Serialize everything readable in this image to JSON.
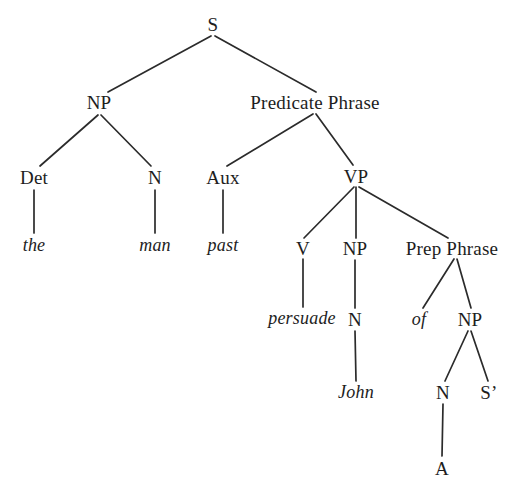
{
  "figure": {
    "kind": "syntax-tree",
    "background_color": "#ffffff",
    "ink_color": "#1d1d1d",
    "line_color": "#2b2b2b",
    "width": 518,
    "height": 500
  },
  "sentence": "the man past persuade John of A",
  "nodes": [
    {
      "id": "S",
      "label": "S",
      "kind": "category",
      "x": 213,
      "y": 24
    },
    {
      "id": "NP1",
      "label": "NP",
      "kind": "category",
      "x": 99,
      "y": 102
    },
    {
      "id": "PredP",
      "label": "Predicate Phrase",
      "kind": "category",
      "x": 315,
      "y": 102
    },
    {
      "id": "Det",
      "label": "Det",
      "kind": "category",
      "x": 34,
      "y": 177
    },
    {
      "id": "N1",
      "label": "N",
      "kind": "category",
      "x": 155,
      "y": 177
    },
    {
      "id": "Aux",
      "label": "Aux",
      "kind": "category",
      "x": 223,
      "y": 177
    },
    {
      "id": "VP",
      "label": "VP",
      "kind": "category",
      "x": 356,
      "y": 176
    },
    {
      "id": "the",
      "label": "the",
      "kind": "terminal",
      "x": 34,
      "y": 245
    },
    {
      "id": "man",
      "label": "man",
      "kind": "terminal",
      "x": 155,
      "y": 245
    },
    {
      "id": "past",
      "label": "past",
      "kind": "terminal",
      "x": 223,
      "y": 245
    },
    {
      "id": "V",
      "label": "V",
      "kind": "category",
      "x": 303,
      "y": 248
    },
    {
      "id": "NP2",
      "label": "NP",
      "kind": "category",
      "x": 355,
      "y": 248
    },
    {
      "id": "PrepP",
      "label": "Prep Phrase",
      "kind": "category",
      "x": 452,
      "y": 248
    },
    {
      "id": "persuade",
      "label": "persuade",
      "kind": "terminal",
      "x": 302,
      "y": 318
    },
    {
      "id": "N2",
      "label": "N",
      "kind": "category",
      "x": 355,
      "y": 319
    },
    {
      "id": "of",
      "label": "of",
      "kind": "terminal",
      "x": 419,
      "y": 319
    },
    {
      "id": "NP3",
      "label": "NP",
      "kind": "category",
      "x": 470,
      "y": 319
    },
    {
      "id": "John",
      "label": "John",
      "kind": "terminal",
      "x": 356,
      "y": 392
    },
    {
      "id": "N3",
      "label": "N",
      "kind": "category",
      "x": 443,
      "y": 392
    },
    {
      "id": "Sbar",
      "label": "S’",
      "kind": "category",
      "x": 489,
      "y": 392
    },
    {
      "id": "A",
      "label": "A",
      "kind": "category",
      "x": 442,
      "y": 468
    }
  ],
  "edges": [
    {
      "from": "S",
      "to": "NP1",
      "x1": 211,
      "y1": 36,
      "x2": 108,
      "y2": 92
    },
    {
      "from": "S",
      "to": "PredP",
      "x1": 215,
      "y1": 36,
      "x2": 316,
      "y2": 92
    },
    {
      "from": "NP1",
      "to": "Det",
      "x1": 98,
      "y1": 115,
      "x2": 40,
      "y2": 166
    },
    {
      "from": "NP1",
      "to": "N1",
      "x1": 101,
      "y1": 115,
      "x2": 151,
      "y2": 166
    },
    {
      "from": "PredP",
      "to": "Aux",
      "x1": 313,
      "y1": 114,
      "x2": 227,
      "y2": 166
    },
    {
      "from": "PredP",
      "to": "VP",
      "x1": 316,
      "y1": 114,
      "x2": 353,
      "y2": 165
    },
    {
      "from": "Det",
      "to": "the",
      "x1": 34,
      "y1": 190,
      "x2": 34,
      "y2": 233
    },
    {
      "from": "N1",
      "to": "man",
      "x1": 155,
      "y1": 190,
      "x2": 155,
      "y2": 233
    },
    {
      "from": "Aux",
      "to": "past",
      "x1": 223,
      "y1": 190,
      "x2": 223,
      "y2": 233
    },
    {
      "from": "VP",
      "to": "V",
      "x1": 354,
      "y1": 187,
      "x2": 304,
      "y2": 238
    },
    {
      "from": "VP",
      "to": "NP2",
      "x1": 356,
      "y1": 187,
      "x2": 356,
      "y2": 238
    },
    {
      "from": "VP",
      "to": "PrepP",
      "x1": 359,
      "y1": 187,
      "x2": 448,
      "y2": 238
    },
    {
      "from": "V",
      "to": "persuade",
      "x1": 303,
      "y1": 259,
      "x2": 303,
      "y2": 307
    },
    {
      "from": "NP2",
      "to": "N2",
      "x1": 355,
      "y1": 260,
      "x2": 355,
      "y2": 308
    },
    {
      "from": "PrepP",
      "to": "of",
      "x1": 454,
      "y1": 259,
      "x2": 423,
      "y2": 308
    },
    {
      "from": "PrepP",
      "to": "NP3",
      "x1": 457,
      "y1": 259,
      "x2": 471,
      "y2": 308
    },
    {
      "from": "N2",
      "to": "John",
      "x1": 355,
      "y1": 331,
      "x2": 356,
      "y2": 381
    },
    {
      "from": "NP3",
      "to": "N3",
      "x1": 468,
      "y1": 331,
      "x2": 445,
      "y2": 381
    },
    {
      "from": "NP3",
      "to": "Sbar",
      "x1": 471,
      "y1": 331,
      "x2": 488,
      "y2": 381
    },
    {
      "from": "N3",
      "to": "A",
      "x1": 443,
      "y1": 404,
      "x2": 442,
      "y2": 456
    }
  ]
}
